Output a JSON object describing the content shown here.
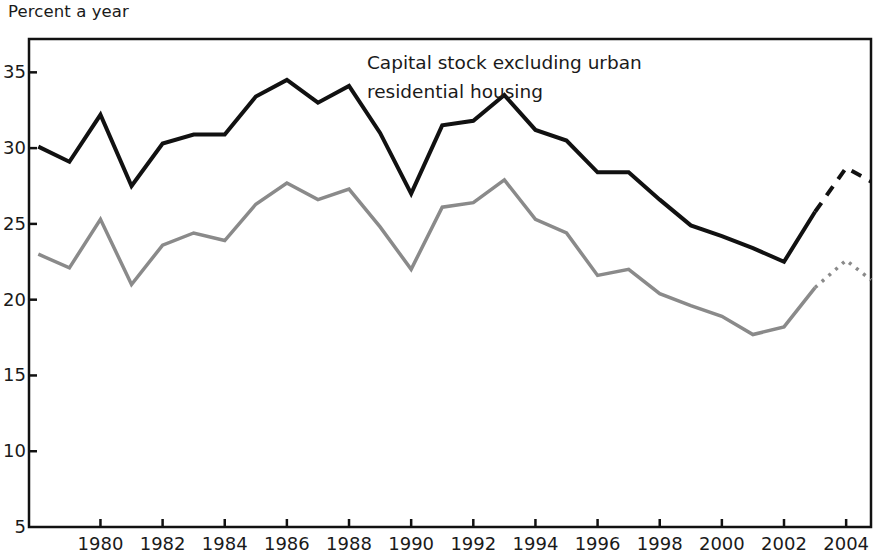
{
  "chart_data": {
    "type": "line",
    "title": "",
    "subtitle": "",
    "ylabel": "Percent a year",
    "xlabel": "",
    "xlim": [
      1977.7,
      2004.8
    ],
    "ylim": [
      5,
      37.2
    ],
    "yticks": [
      5,
      10,
      15,
      20,
      25,
      30,
      35
    ],
    "xticks": [
      1980,
      1982,
      1984,
      1986,
      1988,
      1990,
      1992,
      1994,
      1996,
      1998,
      2000,
      2002,
      2004
    ],
    "grid": false,
    "legend": "none",
    "annotations": [
      {
        "text_lines": [
          "Capital stock excluding urban",
          "residential housing"
        ],
        "x": 1993.0,
        "y": 36.0
      }
    ],
    "series": [
      {
        "name": "Capital stock excluding urban residential housing",
        "color": "#111111",
        "linewidth": 4,
        "x": [
          1978,
          1979,
          1980,
          1981,
          1982,
          1983,
          1984,
          1985,
          1986,
          1987,
          1988,
          1989,
          1990,
          1991,
          1992,
          1993,
          1994,
          1995,
          1996,
          1997,
          1998,
          1999,
          2000,
          2001,
          2002,
          2003
        ],
        "values": [
          30.1,
          29.1,
          32.2,
          27.5,
          30.3,
          30.9,
          30.9,
          33.4,
          34.5,
          33.0,
          34.1,
          31.0,
          27.0,
          31.5,
          31.8,
          33.5,
          31.2,
          30.5,
          28.4,
          28.4,
          26.6,
          24.9,
          24.2,
          23.4,
          22.5,
          25.8
        ],
        "forecast_x": [
          2003,
          2004,
          2004.8
        ],
        "forecast_values": [
          25.8,
          28.7,
          27.8
        ],
        "forecast_style": "dashed"
      },
      {
        "name": "Capital stock (all, including urban residential housing)",
        "color": "#8a8a8a",
        "linewidth": 3.5,
        "x": [
          1978,
          1979,
          1980,
          1981,
          1982,
          1983,
          1984,
          1985,
          1986,
          1987,
          1988,
          1989,
          1990,
          1991,
          1992,
          1993,
          1994,
          1995,
          1996,
          1997,
          1998,
          1999,
          2000,
          2001,
          2002,
          2003
        ],
        "values": [
          23.0,
          22.1,
          25.3,
          21.0,
          23.6,
          24.4,
          23.9,
          26.3,
          27.7,
          26.6,
          27.3,
          24.8,
          22.0,
          26.1,
          26.4,
          27.9,
          25.3,
          24.4,
          21.6,
          22.0,
          20.4,
          19.6,
          18.9,
          17.7,
          18.2,
          20.8
        ],
        "forecast_x": [
          2003,
          2004,
          2004.8
        ],
        "forecast_values": [
          20.8,
          22.6,
          21.3
        ],
        "forecast_style": "dotted"
      }
    ]
  },
  "axes": {
    "ytick_labels": [
      "35",
      "30",
      "25",
      "20",
      "15",
      "10",
      "5"
    ],
    "xtick_labels": [
      "1980",
      "1982",
      "1984",
      "1986",
      "1988",
      "1990",
      "1992",
      "1994",
      "1996",
      "1998",
      "2000",
      "2002",
      "2004"
    ]
  }
}
